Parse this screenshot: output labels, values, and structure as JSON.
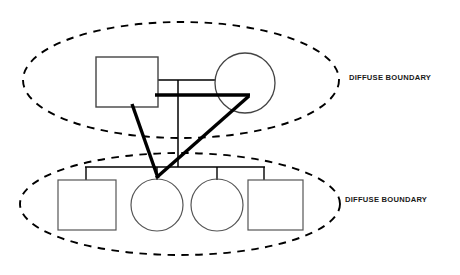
{
  "diagram": {
    "type": "genogram",
    "background_color": "#ffffff",
    "line_color": "#000000",
    "thick_line_color": "#000000",
    "labels": {
      "upper_boundary": "DIFFUSE BOUNDARY",
      "lower_boundary": "DIFFUSE BOUNDARY"
    },
    "subsystems": [
      {
        "name": "parental-subsystem",
        "boundary_style": "dashed-ellipse",
        "boundary_label": "DIFFUSE BOUNDARY",
        "cx": 181,
        "cy": 80,
        "rx": 158,
        "ry": 58,
        "members": [
          {
            "id": "father",
            "shape": "square",
            "label": "",
            "x": 96,
            "y": 57,
            "w": 62,
            "h": 50
          },
          {
            "id": "mother",
            "shape": "circle",
            "label": "",
            "cx": 245,
            "cy": 83,
            "r": 30
          }
        ]
      },
      {
        "name": "sibling-subsystem",
        "boundary_style": "dashed-ellipse",
        "boundary_label": "DIFFUSE BOUNDARY",
        "cx": 180,
        "cy": 204,
        "rx": 160,
        "ry": 51,
        "members": [
          {
            "id": "child-1",
            "shape": "square",
            "label": "",
            "x": 58,
            "y": 180,
            "w": 58,
            "h": 50
          },
          {
            "id": "child-2",
            "shape": "circle",
            "label": "",
            "cx": 157,
            "cy": 205,
            "r": 26
          },
          {
            "id": "child-3",
            "shape": "circle",
            "label": "",
            "cx": 217,
            "cy": 205,
            "r": 26
          },
          {
            "id": "child-4",
            "shape": "square",
            "label": "",
            "x": 248,
            "y": 180,
            "w": 55,
            "h": 50
          }
        ]
      }
    ],
    "relationships": [
      {
        "id": "marriage-line-thin",
        "type": "thin",
        "from": "father",
        "to": "mother",
        "y": 80
      },
      {
        "id": "enmeshment-line-thick",
        "type": "thick",
        "from": "father",
        "to": "mother",
        "y": 95
      },
      {
        "id": "descent-line",
        "type": "thin",
        "x": 178,
        "from_y": 80,
        "to_y": 167
      },
      {
        "id": "sibling-bar",
        "type": "thin",
        "y": 167,
        "x1": 85,
        "x2": 265
      },
      {
        "id": "enmeshment-father-child2",
        "type": "thick",
        "from": "father",
        "to": "child-2"
      },
      {
        "id": "enmeshment-mother-child2",
        "type": "thick",
        "from": "mother",
        "to": "child-2"
      }
    ]
  }
}
